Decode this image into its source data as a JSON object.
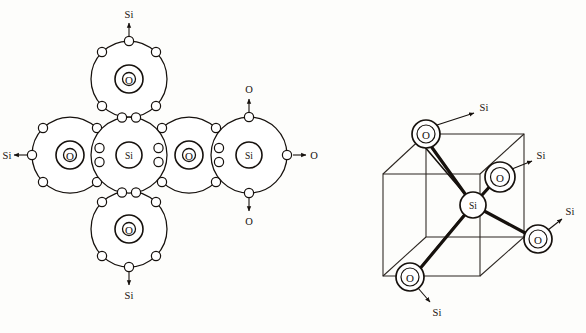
{
  "figure": {
    "ink_color": "#16110d",
    "background_color": "#fdfdfb",
    "panels": [
      {
        "id": "left",
        "name": "electron-shell-diagram",
        "caption": ""
      },
      {
        "id": "right",
        "name": "tetrahedral-cube-diagram",
        "caption": ""
      }
    ]
  },
  "left_panel": {
    "name": "sio2-electron-shell-network",
    "atoms": [
      {
        "id": "si-center",
        "label": "Si",
        "cx": 129,
        "cy": 155,
        "kind": "silicon",
        "shell_r": 38,
        "core_r": 13
      },
      {
        "id": "o-top",
        "label": "O",
        "cx": 129,
        "cy": 79,
        "kind": "oxygen",
        "shell_r": 38,
        "core_r": 14,
        "inner_r": 7
      },
      {
        "id": "o-bottom",
        "label": "O",
        "cx": 129,
        "cy": 229,
        "kind": "oxygen",
        "shell_r": 38,
        "core_r": 14,
        "inner_r": 7
      },
      {
        "id": "o-left",
        "label": "O",
        "cx": 70,
        "cy": 155,
        "kind": "oxygen",
        "shell_r": 38,
        "core_r": 14,
        "inner_r": 7
      },
      {
        "id": "o-right",
        "label": "O",
        "cx": 189,
        "cy": 155,
        "kind": "oxygen",
        "shell_r": 38,
        "core_r": 14,
        "inner_r": 7
      },
      {
        "id": "si-right",
        "label": "Si",
        "cx": 249,
        "cy": 155,
        "kind": "silicon",
        "shell_r": 38,
        "core_r": 13
      }
    ],
    "external_labels": [
      {
        "id": "ext-si-top",
        "text": "Si",
        "x": 129,
        "y": 14,
        "arrow": "up"
      },
      {
        "id": "ext-si-bottom",
        "text": "Si",
        "x": 129,
        "y": 295,
        "arrow": "down"
      },
      {
        "id": "ext-si-left",
        "text": "Si",
        "x": 14,
        "y": 155,
        "arrow": "left"
      },
      {
        "id": "ext-o-top",
        "text": "O",
        "x": 249,
        "y": 86,
        "arrow": "up"
      },
      {
        "id": "ext-o-bottom",
        "text": "O",
        "x": 249,
        "y": 216,
        "arrow": "down"
      },
      {
        "id": "ext-o-right",
        "text": "O",
        "x": 305,
        "y": 152,
        "arrow": "right"
      }
    ],
    "shared_pairs": [
      {
        "id": "pair-si-center-o-top",
        "between": [
          "si-center",
          "o-top"
        ]
      },
      {
        "id": "pair-si-center-o-bottom",
        "between": [
          "si-center",
          "o-bottom"
        ]
      },
      {
        "id": "pair-si-center-o-left",
        "between": [
          "si-center",
          "o-left"
        ]
      },
      {
        "id": "pair-si-center-o-right",
        "between": [
          "si-center",
          "o-right"
        ]
      },
      {
        "id": "pair-o-right-si-right",
        "between": [
          "o-right",
          "si-right"
        ]
      }
    ]
  },
  "right_panel": {
    "name": "sio4-tetrahedron-in-cube",
    "center_atom": {
      "id": "si-cube-center",
      "label": "Si",
      "cx": 473,
      "cy": 205,
      "r": 13
    },
    "corner_atoms": [
      {
        "id": "o-back-top-left",
        "label": "O",
        "cx": 426,
        "cy": 134,
        "r": 14,
        "si_label": "Si",
        "si_x": 483,
        "si_y": 108
      },
      {
        "id": "o-front-top-right",
        "label": "O",
        "cx": 500,
        "cy": 177,
        "r": 15,
        "si_label": "Si",
        "si_x": 540,
        "si_y": 156
      },
      {
        "id": "o-right-lower",
        "label": "O",
        "cx": 538,
        "cy": 239,
        "r": 14,
        "si_label": "Si",
        "si_x": 565,
        "si_y": 210
      },
      {
        "id": "o-front-bottom",
        "label": "O",
        "cx": 410,
        "cy": 277,
        "r": 14,
        "si_label": "Si",
        "si_x": 436,
        "si_y": 312
      }
    ],
    "cube": {
      "name": "unit-cube",
      "front_top_left": {
        "x": 383,
        "y": 174
      },
      "front_top_right": {
        "x": 480,
        "y": 174
      },
      "front_bot_left": {
        "x": 383,
        "y": 276
      },
      "front_bot_right": {
        "x": 480,
        "y": 276
      },
      "back_top_left": {
        "x": 426,
        "y": 134
      },
      "back_top_right": {
        "x": 524,
        "y": 134
      },
      "back_bot_left": {
        "x": 426,
        "y": 237
      },
      "back_bot_right": {
        "x": 524,
        "y": 237
      }
    }
  }
}
